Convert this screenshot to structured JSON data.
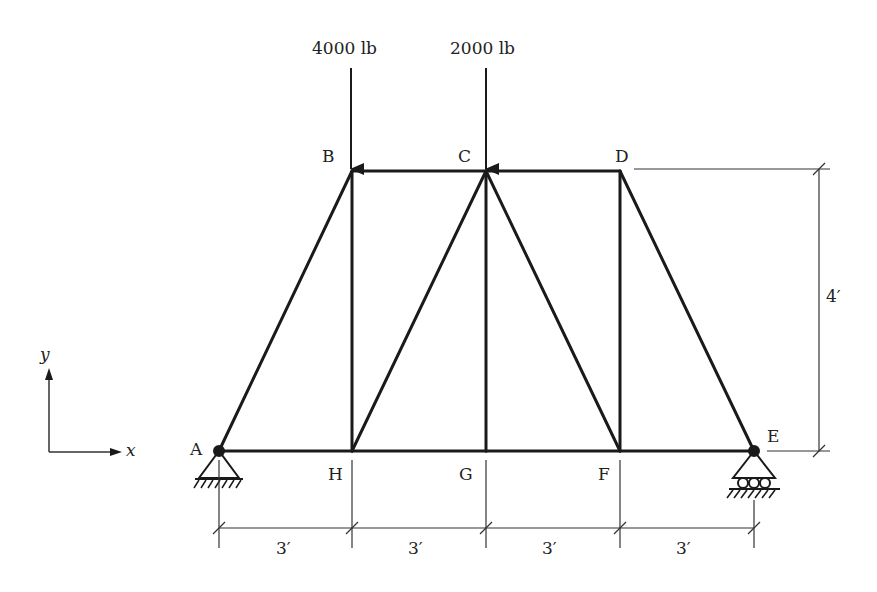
{
  "diagram": {
    "type": "truss",
    "nodes": [
      {
        "id": "A",
        "label": "A",
        "x": 219,
        "y": 451
      },
      {
        "id": "B",
        "label": "B",
        "x": 352,
        "y": 171
      },
      {
        "id": "C",
        "label": "C",
        "x": 486,
        "y": 171
      },
      {
        "id": "D",
        "label": "D",
        "x": 620,
        "y": 171
      },
      {
        "id": "E",
        "label": "E",
        "x": 754,
        "y": 451
      },
      {
        "id": "F",
        "label": "F",
        "x": 620,
        "y": 451
      },
      {
        "id": "G",
        "label": "G",
        "x": 486,
        "y": 451
      },
      {
        "id": "H",
        "label": "H",
        "x": 352,
        "y": 451
      }
    ],
    "members": [
      [
        "A",
        "B"
      ],
      [
        "B",
        "C"
      ],
      [
        "C",
        "D"
      ],
      [
        "D",
        "E"
      ],
      [
        "A",
        "H"
      ],
      [
        "H",
        "G"
      ],
      [
        "G",
        "F"
      ],
      [
        "F",
        "E"
      ],
      [
        "B",
        "H"
      ],
      [
        "H",
        "C"
      ],
      [
        "C",
        "G"
      ],
      [
        "C",
        "F"
      ],
      [
        "D",
        "F"
      ]
    ],
    "loads": [
      {
        "node": "B",
        "label": "4000 lb",
        "direction": "down"
      },
      {
        "node": "C",
        "label": "2000 lb",
        "direction": "down"
      }
    ],
    "supports": [
      {
        "node": "A",
        "type": "pin"
      },
      {
        "node": "E",
        "type": "roller"
      }
    ],
    "dimensions": {
      "horizontal": [
        "3′",
        "3′",
        "3′",
        "3′"
      ],
      "vertical": "4′"
    },
    "axes": {
      "x_label": "x",
      "y_label": "y"
    },
    "colors": {
      "line": "#1a1a1a",
      "thin_line": "#333333",
      "background": "#ffffff"
    }
  }
}
